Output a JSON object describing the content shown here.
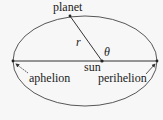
{
  "diagram": {
    "labels": {
      "planet": "planet",
      "r": "r",
      "theta": "θ",
      "sun": "sun",
      "aphelion": "aphelion",
      "perihelion": "perihelion"
    },
    "colors": {
      "stroke": "#333333",
      "background": "#f7f7f7",
      "text": "#222222"
    },
    "geometry": {
      "ellipse": {
        "cx": 85,
        "cy": 61,
        "rx": 72,
        "ry": 45
      },
      "sun": {
        "x": 102,
        "y": 61
      },
      "planet": {
        "x": 70,
        "y": 16
      },
      "aphelion": {
        "x": 13,
        "y": 61
      },
      "perihelion": {
        "x": 157,
        "y": 61
      }
    }
  }
}
